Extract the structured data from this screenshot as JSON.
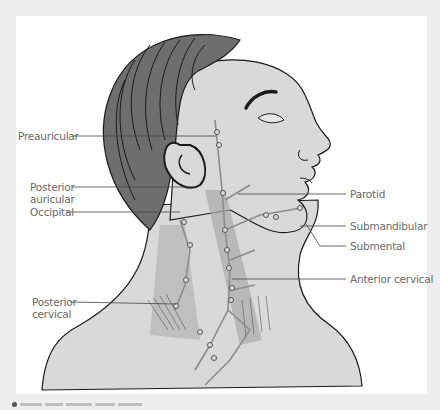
{
  "diagram": {
    "labels_left": [
      {
        "id": "preauricular",
        "text": "Preauricular"
      },
      {
        "id": "posterior-auricular",
        "text": "Posterior\nauricular",
        "line1": "Posterior",
        "line2": "auricular"
      },
      {
        "id": "occipital",
        "text": "Occipital"
      },
      {
        "id": "posterior-cervical",
        "text": "Posterior\ncervical",
        "line1": "Posterior",
        "line2": "cervical"
      }
    ],
    "labels_right": [
      {
        "id": "parotid",
        "text": "Parotid"
      },
      {
        "id": "submandibular",
        "text": "Submandibular"
      },
      {
        "id": "submental",
        "text": "Submental"
      },
      {
        "id": "anterior-cervical",
        "text": "Anterior cervical"
      }
    ],
    "colors": {
      "background": "#eeeeee",
      "panel": "#ffffff",
      "skin": "#d9d9d9",
      "hair": "#6e6e6e",
      "muscle": "#a9a9a9",
      "lymph": "#8c8c8c",
      "outline": "#1a1a1a",
      "label_text": "#6a6a6a",
      "leader_line": "#444444"
    }
  }
}
